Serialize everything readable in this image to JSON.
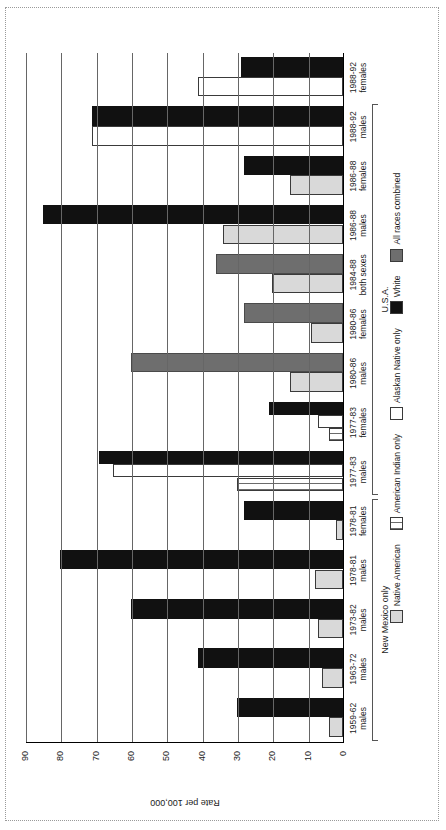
{
  "figure": {
    "ylabel": "Rate per 100,000",
    "yticks": [
      0,
      10,
      20,
      30,
      40,
      50,
      60,
      70,
      80,
      90
    ],
    "groups": [
      {
        "label": "New Mexico only",
        "start": 0,
        "end": 4
      },
      {
        "label": "U.S.A.",
        "start": 5,
        "end": 12
      }
    ]
  },
  "legend": {
    "items": [
      {
        "label": "Native American",
        "swatch": "native-american-swatch",
        "color": "#d9d9d9"
      },
      {
        "label": "American Indian only",
        "swatch": "american-indian-only-swatch",
        "color": "#ffffff"
      },
      {
        "label": "Alaskan Native only",
        "swatch": "alaskan-native-only-swatch",
        "color": "#ffffff"
      },
      {
        "label": "White",
        "swatch": "white-swatch",
        "color": "#111111"
      },
      {
        "label": "All races combined",
        "swatch": "all-races-combined-swatch",
        "color": "#6e6e6e"
      }
    ]
  },
  "chart_data": {
    "type": "bar",
    "title": "",
    "xlabel": "",
    "ylabel": "Rate per 100,000",
    "ylim": [
      0,
      90
    ],
    "grid": true,
    "legend_position": "bottom",
    "orientation": "vertical-rotated",
    "categories": [
      "1959-62 males",
      "1963-72 males",
      "1973-82 males",
      "1978-81 males",
      "1978-81 females",
      "1977-83 males",
      "1977-83 females",
      "1980-86 males",
      "1980-86 females",
      "1984-88 both sexes",
      "1986-88 males",
      "1986-88 females",
      "1988-92 males",
      "1988-92 females"
    ],
    "series": [
      {
        "name": "Native American",
        "color": "#d9d9d9",
        "values": [
          4,
          6,
          7,
          8,
          2,
          null,
          null,
          null,
          null,
          null,
          null,
          null,
          null,
          null
        ]
      },
      {
        "name": "American Indian only",
        "color": "#ffffff",
        "values": [
          null,
          null,
          null,
          null,
          null,
          30,
          4,
          null,
          null,
          null,
          null,
          null,
          null,
          null
        ]
      },
      {
        "name": "Alaskan Native only",
        "color": "#ffffff",
        "values": [
          null,
          null,
          null,
          null,
          null,
          65,
          7,
          null,
          null,
          null,
          null,
          null,
          null,
          41
        ]
      },
      {
        "name": "White",
        "color": "#111111",
        "values": [
          30,
          41,
          60,
          80,
          28,
          69,
          21,
          null,
          null,
          null,
          85,
          28,
          71,
          29
        ]
      },
      {
        "name": "All races combined",
        "color": "#6e6e6e",
        "values": [
          null,
          null,
          null,
          null,
          null,
          null,
          null,
          60,
          28,
          36,
          null,
          null,
          null,
          null
        ]
      },
      {
        "name": "All races combined (light)",
        "color": "#d9d9d9",
        "values": [
          null,
          null,
          null,
          null,
          null,
          null,
          null,
          15,
          9,
          20,
          34,
          15,
          null,
          null
        ]
      }
    ]
  },
  "bars": [
    {
      "cat": 0,
      "series": "Native American",
      "style": "sw-native",
      "value": 4
    },
    {
      "cat": 0,
      "series": "White",
      "style": "sw-white",
      "value": 30
    },
    {
      "cat": 1,
      "series": "Native American",
      "style": "sw-native",
      "value": 6
    },
    {
      "cat": 1,
      "series": "White",
      "style": "sw-white",
      "value": 41
    },
    {
      "cat": 2,
      "series": "Native American",
      "style": "sw-native",
      "value": 7
    },
    {
      "cat": 2,
      "series": "White",
      "style": "sw-white",
      "value": 60
    },
    {
      "cat": 3,
      "series": "Native American",
      "style": "sw-native",
      "value": 8
    },
    {
      "cat": 3,
      "series": "White",
      "style": "sw-white",
      "value": 80
    },
    {
      "cat": 4,
      "series": "Native American",
      "style": "sw-native",
      "value": 2
    },
    {
      "cat": 4,
      "series": "White",
      "style": "sw-white",
      "value": 28
    },
    {
      "cat": 5,
      "series": "American Indian only",
      "style": "sw-ai",
      "value": 30
    },
    {
      "cat": 5,
      "series": "Alaskan Native only",
      "style": "sw-alaskan",
      "value": 65
    },
    {
      "cat": 5,
      "series": "White",
      "style": "sw-white",
      "value": 69
    },
    {
      "cat": 6,
      "series": "American Indian only",
      "style": "sw-ai",
      "value": 4
    },
    {
      "cat": 6,
      "series": "Alaskan Native only",
      "style": "sw-alaskan",
      "value": 7
    },
    {
      "cat": 6,
      "series": "White",
      "style": "sw-white",
      "value": 21
    },
    {
      "cat": 7,
      "series": "Native American",
      "style": "sw-native",
      "value": 15
    },
    {
      "cat": 7,
      "series": "All races combined",
      "style": "sw-all",
      "value": 60
    },
    {
      "cat": 8,
      "series": "Native American",
      "style": "sw-native",
      "value": 9
    },
    {
      "cat": 8,
      "series": "All races combined",
      "style": "sw-all",
      "value": 28
    },
    {
      "cat": 9,
      "series": "Native American",
      "style": "sw-native",
      "value": 20
    },
    {
      "cat": 9,
      "series": "All races combined",
      "style": "sw-all",
      "value": 36
    },
    {
      "cat": 10,
      "series": "Native American",
      "style": "sw-native",
      "value": 34
    },
    {
      "cat": 10,
      "series": "White",
      "style": "sw-white",
      "value": 85
    },
    {
      "cat": 11,
      "series": "Native American",
      "style": "sw-native",
      "value": 15
    },
    {
      "cat": 11,
      "series": "White",
      "style": "sw-white",
      "value": 28
    },
    {
      "cat": 12,
      "series": "Alaskan Native only",
      "style": "sw-alaskan",
      "value": 71
    },
    {
      "cat": 12,
      "series": "White",
      "style": "sw-white",
      "value": 71
    },
    {
      "cat": 13,
      "series": "Alaskan Native only",
      "style": "sw-alaskan",
      "value": 41
    },
    {
      "cat": 13,
      "series": "White",
      "style": "sw-white",
      "value": 29
    }
  ]
}
